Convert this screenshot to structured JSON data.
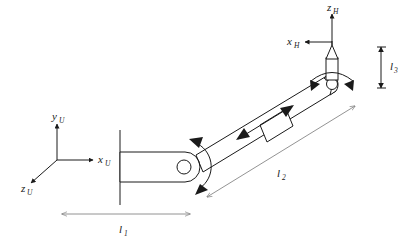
{
  "figure": {
    "background_color": "#ffffff",
    "line_color": "#1a1a1a",
    "dimension_line_color": "#777777"
  },
  "base_frame": {
    "name": "universal-base-frame",
    "origin_label": "",
    "axes": [
      {
        "id": "y_U",
        "label_main": "y",
        "label_sub": "U",
        "direction": "up"
      },
      {
        "id": "x_U",
        "label_main": "x",
        "label_sub": "U",
        "direction": "right"
      },
      {
        "id": "z_U",
        "label_main": "z",
        "label_sub": "U",
        "direction": "down-left"
      }
    ]
  },
  "hand_frame": {
    "name": "hand-end-effector-frame",
    "axes": [
      {
        "id": "z_H",
        "label_main": "z",
        "label_sub": "H",
        "direction": "up"
      },
      {
        "id": "x_H",
        "label_main": "x",
        "label_sub": "H",
        "direction": "left"
      }
    ]
  },
  "dimensions": [
    {
      "id": "l1",
      "label_main": "l",
      "label_sub": "1",
      "orientation": "horizontal",
      "description": "base link length"
    },
    {
      "id": "l2",
      "label_main": "l",
      "label_sub": "2",
      "orientation": "diagonal",
      "description": "upper arm link length"
    },
    {
      "id": "l3",
      "label_main": "l",
      "label_sub": "3",
      "orientation": "vertical",
      "description": "tool offset height"
    }
  ],
  "joints": [
    {
      "id": "shoulder-joint",
      "type": "revolute",
      "motion_arrow": "curved-double-headed"
    },
    {
      "id": "prismatic-joint",
      "type": "prismatic",
      "motion_arrow": "linear-double-headed"
    },
    {
      "id": "wrist-joint",
      "type": "revolute",
      "motion_arrow": "curved-double-headed"
    }
  ],
  "links": [
    {
      "id": "base-link",
      "orientation": "horizontal"
    },
    {
      "id": "upper-arm-link",
      "orientation": "diagonal"
    },
    {
      "id": "tool-tip",
      "shape": "pointed-stylus"
    }
  ]
}
